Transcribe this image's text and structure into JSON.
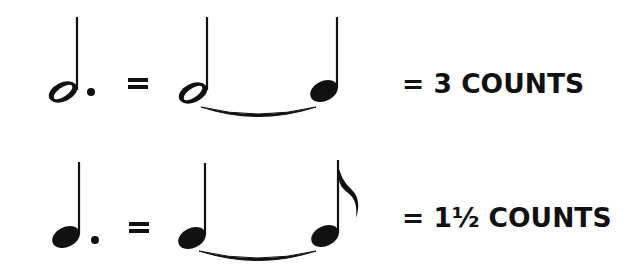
{
  "rows": [
    {
      "left_note": "dotted half note",
      "equals": "=",
      "tied_notes": [
        "half note",
        "quarter note"
      ],
      "result": "= 3 COUNTS"
    },
    {
      "left_note": "dotted quarter note",
      "equals": "=",
      "tied_notes": [
        "quarter note",
        "eighth note"
      ],
      "result": "= 1½ COUNTS"
    }
  ],
  "colors": {
    "ink": "#111111",
    "background": "#ffffff"
  }
}
